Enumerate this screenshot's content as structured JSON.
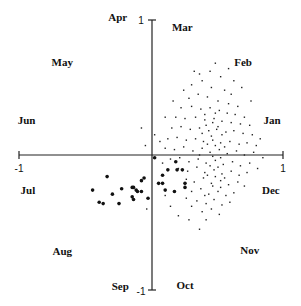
{
  "chart_data": {
    "type": "scatter",
    "title": "",
    "xlabel": "",
    "ylabel": "",
    "xlim": [
      -1,
      1
    ],
    "ylim": [
      -1,
      1
    ],
    "grid": false,
    "axes_through_origin": true,
    "tick_labels": {
      "x_min": "-1",
      "x_max": "1",
      "y_min": "-1",
      "y_max": "1"
    },
    "month_labels": [
      {
        "label": "Jan",
        "x": 0.91,
        "y": 0.26
      },
      {
        "label": "Feb",
        "x": 0.69,
        "y": 0.69
      },
      {
        "label": "Mar",
        "x": 0.23,
        "y": 0.95
      },
      {
        "label": "Apr",
        "x": -0.26,
        "y": 1.02
      },
      {
        "label": "May",
        "x": -0.68,
        "y": 0.69
      },
      {
        "label": "Jun",
        "x": -0.95,
        "y": 0.26
      },
      {
        "label": "Jul",
        "x": -0.94,
        "y": -0.26
      },
      {
        "label": "Aug",
        "x": -0.68,
        "y": -0.71
      },
      {
        "label": "Sep",
        "x": -0.24,
        "y": -0.97
      },
      {
        "label": "Oct",
        "x": 0.25,
        "y": -0.96
      },
      {
        "label": "Nov",
        "x": 0.74,
        "y": -0.7
      },
      {
        "label": "Dec",
        "x": 0.9,
        "y": -0.26
      }
    ],
    "series": [
      {
        "name": "large dots",
        "marker": "filled-circle-large",
        "color": "#111111",
        "points": [
          [
            -0.45,
            -0.26
          ],
          [
            -0.34,
            -0.16
          ],
          [
            -0.4,
            -0.35
          ],
          [
            -0.37,
            -0.36
          ],
          [
            -0.3,
            -0.29
          ],
          [
            -0.25,
            -0.36
          ],
          [
            -0.23,
            -0.25
          ],
          [
            -0.15,
            -0.24
          ],
          [
            -0.14,
            -0.24
          ],
          [
            -0.12,
            -0.26
          ],
          [
            -0.11,
            -0.27
          ],
          [
            -0.15,
            -0.31
          ],
          [
            -0.14,
            -0.33
          ],
          [
            -0.08,
            -0.19
          ],
          [
            -0.06,
            -0.17
          ],
          [
            -0.08,
            -0.27
          ],
          [
            -0.03,
            -0.32
          ],
          [
            0.02,
            -0.02
          ],
          [
            0.12,
            -0.11
          ],
          [
            0.08,
            -0.15
          ],
          [
            0.18,
            -0.05
          ],
          [
            0.19,
            -0.11
          ],
          [
            0.23,
            -0.11
          ],
          [
            0.05,
            -0.21
          ],
          [
            0.08,
            -0.21
          ],
          [
            0.1,
            -0.26
          ],
          [
            0.25,
            -0.21
          ],
          [
            0.25,
            -0.24
          ],
          [
            0.17,
            -0.27
          ]
        ]
      },
      {
        "name": "small dots",
        "marker": "dot-small",
        "color": "#222222",
        "points": [
          [
            0.3,
            0.52
          ],
          [
            0.38,
            0.55
          ],
          [
            0.45,
            0.5
          ],
          [
            0.55,
            0.48
          ],
          [
            0.6,
            0.45
          ],
          [
            0.28,
            0.42
          ],
          [
            0.35,
            0.45
          ],
          [
            0.42,
            0.43
          ],
          [
            0.5,
            0.4
          ],
          [
            0.58,
            0.38
          ],
          [
            0.65,
            0.36
          ],
          [
            0.22,
            0.35
          ],
          [
            0.3,
            0.36
          ],
          [
            0.37,
            0.34
          ],
          [
            0.44,
            0.35
          ],
          [
            0.51,
            0.33
          ],
          [
            0.57,
            0.31
          ],
          [
            0.63,
            0.3
          ],
          [
            0.7,
            0.28
          ],
          [
            0.18,
            0.28
          ],
          [
            0.25,
            0.27
          ],
          [
            0.33,
            0.28
          ],
          [
            0.4,
            0.26
          ],
          [
            0.47,
            0.27
          ],
          [
            0.53,
            0.25
          ],
          [
            0.6,
            0.24
          ],
          [
            0.67,
            0.23
          ],
          [
            0.74,
            0.22
          ],
          [
            0.15,
            0.2
          ],
          [
            0.22,
            0.21
          ],
          [
            0.29,
            0.19
          ],
          [
            0.36,
            0.2
          ],
          [
            0.43,
            0.18
          ],
          [
            0.49,
            0.19
          ],
          [
            0.56,
            0.17
          ],
          [
            0.62,
            0.18
          ],
          [
            0.69,
            0.16
          ],
          [
            0.76,
            0.15
          ],
          [
            0.12,
            0.12
          ],
          [
            0.19,
            0.13
          ],
          [
            0.26,
            0.11
          ],
          [
            0.33,
            0.12
          ],
          [
            0.39,
            0.1
          ],
          [
            0.46,
            0.11
          ],
          [
            0.52,
            0.09
          ],
          [
            0.59,
            0.1
          ],
          [
            0.66,
            0.08
          ],
          [
            0.72,
            0.09
          ],
          [
            0.79,
            0.07
          ],
          [
            0.1,
            0.05
          ],
          [
            0.17,
            0.04
          ],
          [
            0.24,
            0.06
          ],
          [
            0.31,
            0.03
          ],
          [
            0.38,
            0.05
          ],
          [
            0.44,
            0.02
          ],
          [
            0.51,
            0.04
          ],
          [
            0.57,
            0.01
          ],
          [
            0.64,
            0.03
          ],
          [
            0.7,
            0.0
          ],
          [
            0.77,
            0.02
          ],
          [
            0.14,
            -0.03
          ],
          [
            0.21,
            -0.02
          ],
          [
            0.28,
            -0.05
          ],
          [
            0.35,
            -0.03
          ],
          [
            0.41,
            -0.06
          ],
          [
            0.48,
            -0.04
          ],
          [
            0.54,
            -0.07
          ],
          [
            0.61,
            -0.05
          ],
          [
            0.67,
            -0.08
          ],
          [
            0.74,
            -0.06
          ],
          [
            0.2,
            -0.1
          ],
          [
            0.27,
            -0.12
          ],
          [
            0.34,
            -0.09
          ],
          [
            0.4,
            -0.13
          ],
          [
            0.47,
            -0.11
          ],
          [
            0.53,
            -0.14
          ],
          [
            0.6,
            -0.12
          ],
          [
            0.66,
            -0.15
          ],
          [
            0.72,
            -0.13
          ],
          [
            0.26,
            -0.18
          ],
          [
            0.32,
            -0.2
          ],
          [
            0.39,
            -0.17
          ],
          [
            0.45,
            -0.21
          ],
          [
            0.52,
            -0.19
          ],
          [
            0.58,
            -0.22
          ],
          [
            0.65,
            -0.2
          ],
          [
            0.7,
            -0.23
          ],
          [
            0.3,
            -0.27
          ],
          [
            0.37,
            -0.25
          ],
          [
            0.43,
            -0.29
          ],
          [
            0.5,
            -0.27
          ],
          [
            0.56,
            -0.3
          ],
          [
            0.62,
            -0.28
          ],
          [
            0.34,
            -0.34
          ],
          [
            0.41,
            -0.36
          ],
          [
            0.47,
            -0.33
          ],
          [
            0.53,
            -0.37
          ],
          [
            0.59,
            -0.35
          ],
          [
            0.38,
            -0.42
          ],
          [
            0.45,
            -0.4
          ],
          [
            0.51,
            -0.44
          ],
          [
            0.41,
            -0.48
          ],
          [
            0.3,
            -0.38
          ],
          [
            0.26,
            -0.32
          ],
          [
            0.44,
            0.62
          ],
          [
            0.52,
            0.58
          ],
          [
            0.36,
            0.6
          ],
          [
            0.62,
            0.55
          ],
          [
            0.4,
            0.3
          ],
          [
            0.48,
            0.31
          ],
          [
            0.46,
            0.24
          ],
          [
            0.41,
            0.22
          ],
          [
            0.5,
            0.21
          ],
          [
            0.38,
            0.16
          ],
          [
            0.45,
            0.14
          ],
          [
            0.53,
            0.15
          ],
          [
            0.42,
            0.08
          ],
          [
            0.48,
            0.07
          ],
          [
            0.55,
            0.06
          ],
          [
            0.36,
            0.0
          ],
          [
            0.46,
            -0.01
          ],
          [
            0.52,
            -0.02
          ],
          [
            0.44,
            -0.08
          ],
          [
            0.5,
            -0.09
          ],
          [
            0.42,
            -0.15
          ],
          [
            0.48,
            -0.16
          ],
          [
            0.55,
            -0.17
          ],
          [
            0.46,
            -0.23
          ],
          [
            0.52,
            -0.24
          ],
          [
            0.4,
            -0.3
          ],
          [
            0.82,
            0.12
          ],
          [
            0.84,
            -0.02
          ],
          [
            0.8,
            -0.1
          ],
          [
            0.06,
            0.1
          ],
          [
            0.08,
            -0.06
          ],
          [
            -0.05,
            0.07
          ],
          [
            0.02,
            0.15
          ],
          [
            0.1,
            0.28
          ],
          [
            0.16,
            0.4
          ],
          [
            0.24,
            0.48
          ],
          [
            0.32,
            0.62
          ],
          [
            0.2,
            -0.45
          ],
          [
            0.28,
            -0.48
          ],
          [
            0.14,
            -0.38
          ],
          [
            0.1,
            -0.3
          ],
          [
            -0.04,
            -0.4
          ],
          [
            0.36,
            -0.55
          ],
          [
            -0.08,
            0.2
          ],
          [
            0.48,
            0.68
          ],
          [
            0.58,
            0.64
          ],
          [
            0.68,
            0.5
          ],
          [
            0.75,
            0.4
          ]
        ]
      }
    ]
  }
}
